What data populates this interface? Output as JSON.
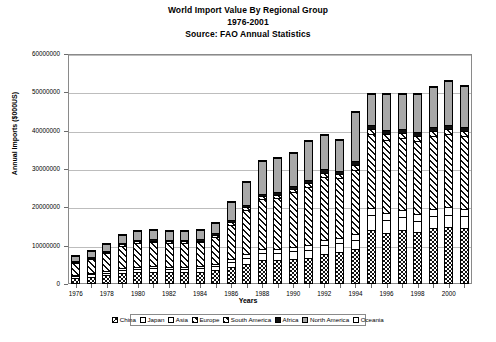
{
  "chart_data": {
    "type": "bar",
    "stacked": true,
    "title": "World Import Value By Regional Group",
    "subtitle": "1976-2001",
    "source": "Source: FAO Annual Statistics",
    "xlabel": "Years",
    "ylabel": "Annual Imports ($000US)",
    "ylim": [
      0,
      60000000
    ],
    "ytick_labels": [
      "0",
      "10000000",
      "20000000",
      "30000000",
      "40000000",
      "50000000",
      "60000000"
    ],
    "ytick_values": [
      0,
      10000000,
      20000000,
      30000000,
      40000000,
      50000000,
      60000000
    ],
    "grid": true,
    "legend_position": "bottom",
    "categories": [
      "1976",
      "1977",
      "1978",
      "1979",
      "1980",
      "1981",
      "1982",
      "1983",
      "1984",
      "1985",
      "1986",
      "1987",
      "1988",
      "1989",
      "1990",
      "1991",
      "1992",
      "1993",
      "1994",
      "1995",
      "1996",
      "1997",
      "1998",
      "1999",
      "2000",
      "2001"
    ],
    "xtick_labels": [
      "1976",
      "",
      "1978",
      "",
      "1980",
      "",
      "1982",
      "",
      "1984",
      "",
      "1986",
      "",
      "1988",
      "",
      "1990",
      "",
      "1992",
      "",
      "1994",
      "",
      "1996",
      "",
      "1998",
      "",
      "2000",
      ""
    ],
    "series": [
      {
        "name": "China",
        "pattern": "checkerboard",
        "color": "#ffffff",
        "values": [
          1600000,
          1900000,
          2300000,
          2900000,
          3100000,
          3200000,
          3100000,
          3100000,
          3200000,
          3600000,
          4500000,
          5300000,
          6200000,
          6300000,
          6500000,
          6900000,
          7900000,
          8400000,
          9200000,
          14200000,
          13300000,
          14000000,
          13600000,
          14700000,
          14900000,
          14600000
        ]
      },
      {
        "name": "Japan",
        "pattern": "solid-white",
        "color": "#ffffff",
        "values": [
          500000,
          600000,
          700000,
          800000,
          900000,
          900000,
          900000,
          900000,
          900000,
          1000000,
          1300000,
          1600000,
          1900000,
          1900000,
          2000000,
          2100000,
          2200000,
          2300000,
          2400000,
          3700000,
          3500000,
          3400000,
          2900000,
          3100000,
          3200000,
          3100000
        ]
      },
      {
        "name": "Asia",
        "pattern": "solid-white",
        "color": "#ffffff",
        "values": [
          300000,
          400000,
          400000,
          500000,
          500000,
          500000,
          500000,
          500000,
          500000,
          600000,
          700000,
          900000,
          1000000,
          1000000,
          1100000,
          1200000,
          1300000,
          1300000,
          1400000,
          1900000,
          1800000,
          1900000,
          1700000,
          1800000,
          1900000,
          1800000
        ]
      },
      {
        "name": "Europe",
        "pattern": "diagonal-hatch",
        "color": "#ffffff",
        "values": [
          3200000,
          3700000,
          4700000,
          5800000,
          6300000,
          6300000,
          6200000,
          6200000,
          6300000,
          7100000,
          9000000,
          11500000,
          13000000,
          13300000,
          14300000,
          15200000,
          16500000,
          15600000,
          16800000,
          19300000,
          19100000,
          18700000,
          19000000,
          18900000,
          19100000,
          19000000
        ]
      },
      {
        "name": "South America",
        "pattern": "diagonal-hatch",
        "color": "#ffffff",
        "values": [
          200000,
          300000,
          300000,
          400000,
          400000,
          400000,
          400000,
          400000,
          400000,
          500000,
          600000,
          700000,
          800000,
          800000,
          900000,
          1000000,
          1100000,
          1100000,
          1200000,
          1400000,
          1400000,
          1400000,
          1400000,
          1400000,
          1400000,
          1400000
        ]
      },
      {
        "name": "Africa",
        "pattern": "solid-black",
        "color": "#111111",
        "values": [
          200000,
          200000,
          300000,
          300000,
          400000,
          400000,
          400000,
          400000,
          400000,
          400000,
          500000,
          600000,
          700000,
          700000,
          800000,
          800000,
          900000,
          900000,
          1000000,
          1100000,
          1100000,
          1100000,
          1100000,
          1100000,
          1100000,
          1100000
        ]
      },
      {
        "name": "North America",
        "pattern": "solid-gray",
        "color": "#a8a8a8",
        "values": [
          1200000,
          1400000,
          1700000,
          2100000,
          2300000,
          2300000,
          2300000,
          2300000,
          2400000,
          2700000,
          4800000,
          6100000,
          8500000,
          8800000,
          8700000,
          10200000,
          9100000,
          7900000,
          12800000,
          7900000,
          9400000,
          9100000,
          10000000,
          10500000,
          11500000,
          10600000
        ]
      },
      {
        "name": "Oceania",
        "pattern": "solid-white",
        "color": "#ffffff",
        "values": [
          100000,
          100000,
          100000,
          100000,
          100000,
          100000,
          100000,
          100000,
          100000,
          100000,
          100000,
          100000,
          100000,
          100000,
          100000,
          100000,
          100000,
          100000,
          100000,
          100000,
          100000,
          100000,
          100000,
          100000,
          100000,
          100000
        ]
      }
    ],
    "totals": [
      7300000,
      8600000,
      10500000,
      12900000,
      14000000,
      14100000,
      13900000,
      13900000,
      14200000,
      16000000,
      21500000,
      26800000,
      32200000,
      33100000,
      34400000,
      37500000,
      39100000,
      38600000,
      45100000,
      49600000,
      49700000,
      49700000,
      49800000,
      51600000,
      53200000,
      51700000
    ]
  }
}
